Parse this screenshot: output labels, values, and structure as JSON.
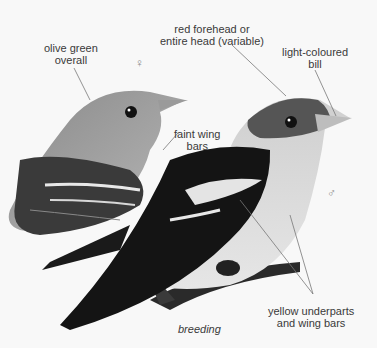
{
  "labels": {
    "olive_green": [
      "olive green",
      "overall"
    ],
    "red_forehead": [
      "red forehead or",
      "entire head (variable)"
    ],
    "light_bill": [
      "light-coloured",
      "bill"
    ],
    "faint_wing": [
      "faint wing",
      "bars"
    ],
    "yellow_under": [
      "yellow underparts",
      "and wing bars"
    ],
    "caption": "breeding"
  },
  "symbols": {
    "female": "♀",
    "male": "♂"
  },
  "colors": {
    "background": "#f8f8f8",
    "text": "#3a3a3a",
    "leader_line": "#777777"
  }
}
